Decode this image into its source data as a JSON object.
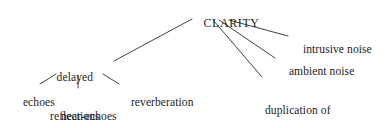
{
  "diagram": {
    "type": "tree",
    "title": "CLARITY",
    "root": {
      "id": "clarity",
      "label": "CLARITY"
    },
    "nodes": [
      {
        "id": "delayed-reflections",
        "label_line1": "delayed",
        "label_line2": "reflections",
        "parent": "clarity"
      },
      {
        "id": "echoes",
        "label": "echoes",
        "parent": "delayed-reflections"
      },
      {
        "id": "near-echoes",
        "label": "near-echoes",
        "parent": "delayed-reflections"
      },
      {
        "id": "reverberation",
        "label": "reverberation",
        "parent": "delayed-reflections"
      },
      {
        "id": "duplication",
        "label_line1": "duplication of",
        "label_line2": "sound source by",
        "label_line3": "loudspeakers",
        "trailing_mark": "ˈ",
        "parent": "clarity"
      },
      {
        "id": "ambient-noise",
        "label": "ambient noise",
        "parent": "clarity"
      },
      {
        "id": "intrusive-noise",
        "label": "intrusive noise",
        "parent": "clarity"
      }
    ],
    "edges": [
      {
        "from": "clarity",
        "to": "delayed-reflections"
      },
      {
        "from": "clarity",
        "to": "duplication"
      },
      {
        "from": "clarity",
        "to": "ambient-noise"
      },
      {
        "from": "clarity",
        "to": "intrusive-noise"
      },
      {
        "from": "delayed-reflections",
        "to": "echoes"
      },
      {
        "from": "delayed-reflections",
        "to": "near-echoes"
      },
      {
        "from": "delayed-reflections",
        "to": "reverberation"
      }
    ],
    "style": {
      "line_color": "#2b2b2b",
      "text_color": "#1c1c1c",
      "background": "#ffffff"
    }
  }
}
